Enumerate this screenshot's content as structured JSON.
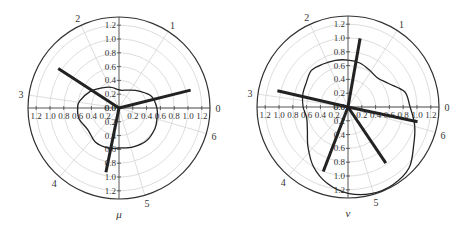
{
  "chart_data": [
    {
      "type": "polar",
      "title": "",
      "variable_label": "μ",
      "center_px": [
        119,
        108
      ],
      "outer_radius_px": 91,
      "px_per_unit": 69,
      "radial_ticks": [
        "0.0",
        "0.2",
        "0.4",
        "0.6",
        "0.8",
        "1.0",
        "1.2"
      ],
      "radial_tick_values": [
        0,
        0.2,
        0.4,
        0.6,
        0.8,
        1.0,
        1.2
      ],
      "angle_labels": [
        "0",
        "1",
        "2",
        "3",
        "4",
        "5",
        "6"
      ],
      "angle_units": "radians",
      "grid": true,
      "rays": [
        {
          "angle_deg": 14,
          "r": 1.07
        },
        {
          "angle_deg": 147,
          "r": 1.05
        },
        {
          "angle_deg": 258.5,
          "r": 0.95
        }
      ],
      "curve": {
        "description": "closed peanut-shaped boundary",
        "points": [
          [
            0,
            0.55
          ],
          [
            20,
            0.5
          ],
          [
            40,
            0.38
          ],
          [
            60,
            0.3
          ],
          [
            80,
            0.26
          ],
          [
            95,
            0.27
          ],
          [
            110,
            0.32
          ],
          [
            130,
            0.38
          ],
          [
            150,
            0.48
          ],
          [
            170,
            0.58
          ],
          [
            180,
            0.6
          ],
          [
            195,
            0.6
          ],
          [
            215,
            0.55
          ],
          [
            235,
            0.6
          ],
          [
            255,
            0.6
          ],
          [
            270,
            0.58
          ],
          [
            290,
            0.6
          ],
          [
            310,
            0.62
          ],
          [
            330,
            0.6
          ],
          [
            345,
            0.57
          ],
          [
            360,
            0.55
          ]
        ]
      }
    },
    {
      "type": "polar",
      "title": "",
      "variable_label": "ν",
      "center_px": [
        348,
        107
      ],
      "outer_radius_px": 91,
      "px_per_unit": 69,
      "radial_ticks": [
        "0.0",
        "0.2",
        "0.4",
        "0.6",
        "0.8",
        "1.0",
        "1.2"
      ],
      "radial_tick_values": [
        0,
        0.2,
        0.4,
        0.6,
        0.8,
        1.0,
        1.2
      ],
      "angle_labels": [
        "0",
        "1",
        "2",
        "3",
        "4",
        "5",
        "6"
      ],
      "angle_units": "radians",
      "grid": true,
      "rays": [
        {
          "angle_deg": 80,
          "r": 1.01
        },
        {
          "angle_deg": 167,
          "r": 1.05
        },
        {
          "angle_deg": 249,
          "r": 1.0
        },
        {
          "angle_deg": 304,
          "r": 0.98
        },
        {
          "angle_deg": 348,
          "r": 1.03
        }
      ],
      "curve": {
        "description": "closed irregular loop",
        "points": [
          [
            0,
            0.9
          ],
          [
            15,
            0.85
          ],
          [
            30,
            0.68
          ],
          [
            45,
            0.6
          ],
          [
            60,
            0.62
          ],
          [
            75,
            0.66
          ],
          [
            90,
            0.68
          ],
          [
            105,
            0.7
          ],
          [
            120,
            0.72
          ],
          [
            135,
            0.75
          ],
          [
            150,
            0.7
          ],
          [
            165,
            0.68
          ],
          [
            180,
            0.65
          ],
          [
            195,
            0.62
          ],
          [
            210,
            0.68
          ],
          [
            225,
            0.82
          ],
          [
            240,
            1.0
          ],
          [
            255,
            1.15
          ],
          [
            270,
            1.25
          ],
          [
            285,
            1.3
          ],
          [
            300,
            1.3
          ],
          [
            315,
            1.25
          ],
          [
            330,
            1.1
          ],
          [
            345,
            1.0
          ],
          [
            360,
            0.9
          ]
        ]
      }
    }
  ],
  "labels": {
    "left_variable": "μ",
    "right_variable": "ν"
  }
}
